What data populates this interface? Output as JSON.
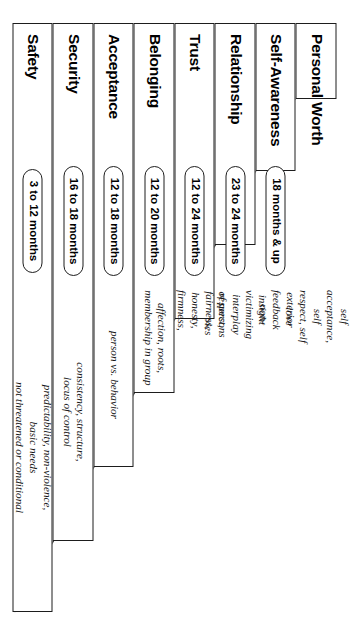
{
  "diagram": {
    "type": "pyramid",
    "orientation": "rotated-90-clockwise",
    "shape": "right-triangle-stepped",
    "tier_count": 8,
    "columns": {
      "title": "Level",
      "age": "Age range",
      "descriptor": "Descriptors"
    },
    "tiers": [
      {
        "index": 1,
        "title": "Personal Worth",
        "age": "",
        "has_age_pill": false,
        "descriptor": "self acceptance, self\nrespect, self love"
      },
      {
        "index": 2,
        "title": "Self-Awareness",
        "age": "18 months & up",
        "has_age_pill": true,
        "descriptor": "exterior feedback\ninsight"
      },
      {
        "index": 3,
        "title": "Relationship",
        "age": "23 to 24 months",
        "has_age_pill": true,
        "descriptor": "non-victimizing interplay\nof persons and roles"
      },
      {
        "index": 4,
        "title": "Trust",
        "age": "12 to 24 months",
        "has_age_pill": true,
        "descriptor": "respect, fairness, honesty,\nfirmness, power"
      },
      {
        "index": 5,
        "title": "Belonging",
        "age": "12 to 20 months",
        "has_age_pill": true,
        "descriptor": "affection, roots,\nmembership in group"
      },
      {
        "index": 6,
        "title": "Acceptance",
        "age": "12 to 18 months",
        "has_age_pill": true,
        "descriptor": "person vs. behavior"
      },
      {
        "index": 7,
        "title": "Security",
        "age": "16 to 18 months",
        "has_age_pill": true,
        "descriptor": "consistency, structure,\nlocus of control"
      },
      {
        "index": 8,
        "title": "Safety",
        "age": "3 to 12 months",
        "has_age_pill": true,
        "descriptor": "predictability, non-violence,\nbasic needs\nnot threatened or conditional"
      }
    ],
    "colors": {
      "stroke": "#1d1d1d",
      "fill": "#ffffff",
      "text": "#000000"
    }
  }
}
